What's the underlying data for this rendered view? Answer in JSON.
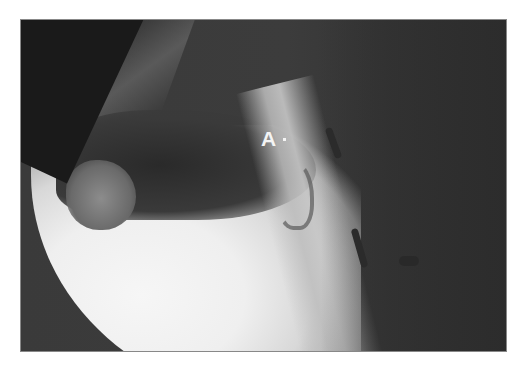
{
  "figure": {
    "type": "lateral fluoroscopy radiograph of head and neck",
    "annotations": [
      {
        "label": "A",
        "marker": "·"
      }
    ],
    "colors": {
      "background": "#ffffff",
      "dark_region": "#2e2e2e",
      "bright_region": "#f2f2f2",
      "label_text": "#f4f4f4"
    }
  }
}
